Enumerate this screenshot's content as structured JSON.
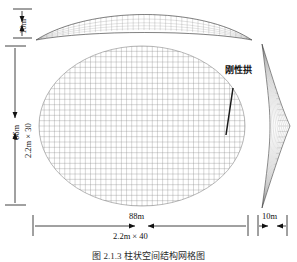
{
  "figure": {
    "caption": "图 2.1.3  柱状空间结构网格图",
    "annotations": [
      {
        "name": "rigid-arch",
        "text": "刚性拱"
      }
    ]
  },
  "dimensions": {
    "top_rise": {
      "label": "10m",
      "orientation": "vertical"
    },
    "plan_height": {
      "label": "66m",
      "orientation": "vertical"
    },
    "plan_height_grid": {
      "label": "2.2m × 30",
      "orientation": "vertical"
    },
    "plan_width": {
      "label": "88m",
      "orientation": "horizontal"
    },
    "plan_width_grid": {
      "label": "2.2m × 40",
      "orientation": "horizontal"
    },
    "side_rise": {
      "label": "10m",
      "orientation": "horizontal"
    }
  },
  "views": {
    "top_elevation": {
      "name": "top-elevation-view",
      "shape": "shallow-lens-mesh"
    },
    "plan": {
      "name": "plan-view",
      "shape": "elliptical-grid-mesh",
      "cells_x": 40,
      "cells_y": 30
    },
    "side_elevation": {
      "name": "side-elevation-view",
      "shape": "pointed-lens-mesh"
    }
  },
  "chart_data": {
    "type": "diagram",
    "title": "图 2.1.3  柱状空间结构网格图",
    "structure": "lens-shaped spatial grid shell",
    "plan_span_x_m": 88,
    "plan_span_y_m": 66,
    "grid_module_m": 2.2,
    "grid_count_x": 40,
    "grid_count_y": 30,
    "rise_top_m": 10,
    "rise_side_m": 10,
    "labels": [
      "10m",
      "66m",
      "2.2m × 30",
      "88m",
      "2.2m × 40",
      "10m",
      "刚性拱"
    ]
  }
}
